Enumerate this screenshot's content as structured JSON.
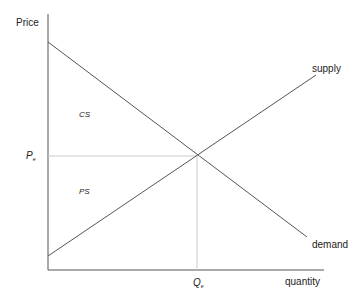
{
  "diagram": {
    "axes": {
      "y_label": "Price",
      "x_label": "quantity"
    },
    "curves": {
      "supply_label": "supply",
      "demand_label": "demand"
    },
    "equilibrium": {
      "price_label": "P",
      "price_subscript": "e",
      "quantity_label": "Q",
      "quantity_subscript": "e"
    },
    "regions": {
      "consumer_surplus": "CS",
      "producer_surplus": "PS"
    },
    "colors": {
      "axis": "#555555",
      "curve": "#555555",
      "guide": "#cccccc",
      "text": "#222222"
    }
  }
}
